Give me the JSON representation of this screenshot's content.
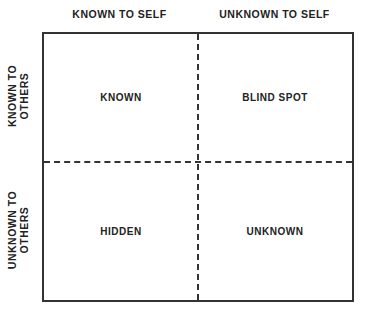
{
  "columns": {
    "left": "KNOWN TO SELF",
    "right": "UNKNOWN TO SELF"
  },
  "rows": {
    "top_line1": "KNOWN TO",
    "top_line2": "OTHERS",
    "bottom_line1": "UNKNOWN TO",
    "bottom_line2": "OTHERS"
  },
  "quadrants": {
    "top_left": "KNOWN",
    "top_right": "BLIND SPOT",
    "bottom_left": "HIDDEN",
    "bottom_right": "UNKNOWN"
  },
  "colors": {
    "line": "#333333",
    "text": "#222222",
    "background": "#ffffff"
  }
}
